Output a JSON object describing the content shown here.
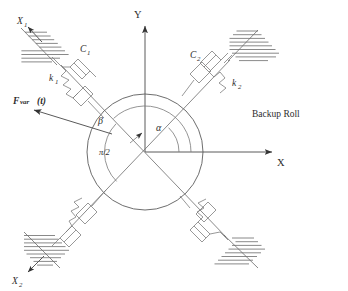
{
  "figure": {
    "background_color": "#ffffff",
    "line_color": "#6b6b6b",
    "text_color": "#2d2d2d"
  },
  "axes": {
    "y_label": "Y",
    "x_label": "X",
    "origin_label": ""
  },
  "angles": [
    {
      "name": "alpha",
      "symbol": "α",
      "description": "angle from +X axis to support axis 2"
    },
    {
      "name": "beta",
      "symbol": "β",
      "description": "angle from +X axis to force direction"
    },
    {
      "name": "pi_over_two",
      "symbol": "π/2",
      "description": "right angle between the two support axes"
    }
  ],
  "supports": [
    {
      "id": "support-1",
      "position": "upper-left",
      "axis_label": "X",
      "axis_subscript": "1",
      "damper_label": "C",
      "damper_subscript": "1",
      "spring_label": "k",
      "spring_subscript": "1"
    },
    {
      "id": "support-2",
      "position": "upper-right",
      "axis_label": "",
      "axis_subscript": "",
      "damper_label": "C",
      "damper_subscript": "2",
      "spring_label": "k",
      "spring_subscript": "2"
    },
    {
      "id": "support-3",
      "position": "lower-left",
      "axis_label": "X",
      "axis_subscript": "2",
      "damper_label": "",
      "damper_subscript": "",
      "spring_label": "",
      "spring_subscript": ""
    },
    {
      "id": "support-4",
      "position": "lower-right",
      "axis_label": "",
      "axis_subscript": "",
      "damper_label": "",
      "damper_subscript": "",
      "spring_label": "",
      "spring_subscript": ""
    }
  ],
  "force": {
    "label_main": "F",
    "label_sub": "var",
    "label_tail": "(t)",
    "description": "variable external force applied to the roll"
  },
  "roll": {
    "caption": "Backup Roll",
    "center_x": 145,
    "center_y": 152,
    "radius": 58
  }
}
